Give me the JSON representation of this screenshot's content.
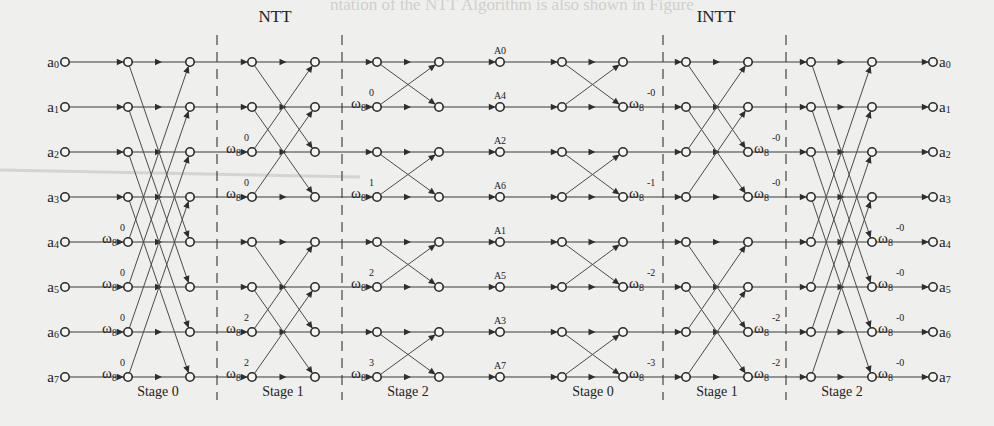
{
  "figure": {
    "sections": [
      {
        "label": "NTT",
        "x": 275,
        "y": 22
      },
      {
        "label": "INTT",
        "x": 716,
        "y": 22
      }
    ],
    "bleed_text": "ntation of the NTT Algorithm is also shown in Figure"
  },
  "layout": {
    "rows_y": [
      62,
      107,
      152,
      197,
      242,
      287,
      332,
      377
    ],
    "input_node_x": 65,
    "output_node_x": 933,
    "dividers_x": [
      217,
      342,
      663,
      786
    ],
    "divider_y": [
      35,
      400
    ]
  },
  "inputs": [
    {
      "base": "a",
      "sub": "0"
    },
    {
      "base": "a",
      "sub": "1"
    },
    {
      "base": "a",
      "sub": "2"
    },
    {
      "base": "a",
      "sub": "3"
    },
    {
      "base": "a",
      "sub": "4"
    },
    {
      "base": "a",
      "sub": "5"
    },
    {
      "base": "a",
      "sub": "6"
    },
    {
      "base": "a",
      "sub": "7"
    }
  ],
  "outputs": [
    {
      "base": "a",
      "sub": "0"
    },
    {
      "base": "a",
      "sub": "1"
    },
    {
      "base": "a",
      "sub": "2"
    },
    {
      "base": "a",
      "sub": "3"
    },
    {
      "base": "a",
      "sub": "4"
    },
    {
      "base": "a",
      "sub": "5"
    },
    {
      "base": "a",
      "sub": "6"
    },
    {
      "base": "a",
      "sub": "7"
    }
  ],
  "intermediate": {
    "x": 500,
    "labels": [
      "A0",
      "A4",
      "A2",
      "A6",
      "A1",
      "A5",
      "A3",
      "A7"
    ]
  },
  "stages": [
    {
      "name": "Stage 0",
      "group": "NTT",
      "x1": 128,
      "x2": 190,
      "label_x": 158,
      "pairs": [
        [
          0,
          4
        ],
        [
          1,
          5
        ],
        [
          2,
          6
        ],
        [
          3,
          7
        ]
      ],
      "twiddles": [
        {
          "row": 4,
          "side": "left",
          "base": "ω",
          "sub": "8",
          "exp": "0"
        },
        {
          "row": 5,
          "side": "left",
          "base": "ω",
          "sub": "8",
          "exp": "0"
        },
        {
          "row": 6,
          "side": "left",
          "base": "ω",
          "sub": "8",
          "exp": "0"
        },
        {
          "row": 7,
          "side": "left",
          "base": "ω",
          "sub": "8",
          "exp": "0"
        }
      ]
    },
    {
      "name": "Stage 1",
      "group": "NTT",
      "x1": 252,
      "x2": 315,
      "label_x": 283,
      "pairs": [
        [
          0,
          2
        ],
        [
          1,
          3
        ],
        [
          4,
          6
        ],
        [
          5,
          7
        ]
      ],
      "twiddles": [
        {
          "row": 2,
          "side": "left",
          "base": "ω",
          "sub": "8",
          "exp": "0"
        },
        {
          "row": 3,
          "side": "left",
          "base": "ω",
          "sub": "8",
          "exp": "0"
        },
        {
          "row": 6,
          "side": "left",
          "base": "ω",
          "sub": "8",
          "exp": "2"
        },
        {
          "row": 7,
          "side": "left",
          "base": "ω",
          "sub": "8",
          "exp": "2"
        }
      ]
    },
    {
      "name": "Stage 2",
      "group": "NTT",
      "x1": 377,
      "x2": 439,
      "label_x": 408,
      "pairs": [
        [
          0,
          1
        ],
        [
          2,
          3
        ],
        [
          4,
          5
        ],
        [
          6,
          7
        ]
      ],
      "twiddles": [
        {
          "row": 1,
          "side": "left",
          "base": "ω",
          "sub": "8",
          "exp": "0"
        },
        {
          "row": 3,
          "side": "left",
          "base": "ω",
          "sub": "8",
          "exp": "1"
        },
        {
          "row": 5,
          "side": "left",
          "base": "ω",
          "sub": "8",
          "exp": "2"
        },
        {
          "row": 7,
          "side": "left",
          "base": "ω",
          "sub": "8",
          "exp": "3"
        }
      ]
    },
    {
      "name": "Stage 0",
      "group": "INTT",
      "x1": 562,
      "x2": 623,
      "label_x": 593,
      "pairs": [
        [
          0,
          1
        ],
        [
          2,
          3
        ],
        [
          4,
          5
        ],
        [
          6,
          7
        ]
      ],
      "twiddles": [
        {
          "row": 1,
          "side": "right",
          "base": "ω",
          "sub": "8",
          "exp": "-0"
        },
        {
          "row": 3,
          "side": "right",
          "base": "ω",
          "sub": "8",
          "exp": "-1"
        },
        {
          "row": 5,
          "side": "right",
          "base": "ω",
          "sub": "8",
          "exp": "-2"
        },
        {
          "row": 7,
          "side": "right",
          "base": "ω",
          "sub": "8",
          "exp": "-3"
        }
      ]
    },
    {
      "name": "Stage 1",
      "group": "INTT",
      "x1": 686,
      "x2": 748,
      "label_x": 717,
      "pairs": [
        [
          0,
          2
        ],
        [
          1,
          3
        ],
        [
          4,
          6
        ],
        [
          5,
          7
        ]
      ],
      "twiddles": [
        {
          "row": 2,
          "side": "right",
          "base": "ω",
          "sub": "8",
          "exp": "-0"
        },
        {
          "row": 3,
          "side": "right",
          "base": "ω",
          "sub": "8",
          "exp": "-0"
        },
        {
          "row": 6,
          "side": "right",
          "base": "ω",
          "sub": "8",
          "exp": "-2"
        },
        {
          "row": 7,
          "side": "right",
          "base": "ω",
          "sub": "8",
          "exp": "-2"
        }
      ]
    },
    {
      "name": "Stage 2",
      "group": "INTT",
      "x1": 811,
      "x2": 872,
      "label_x": 842,
      "pairs": [
        [
          0,
          4
        ],
        [
          1,
          5
        ],
        [
          2,
          6
        ],
        [
          3,
          7
        ]
      ],
      "twiddles": [
        {
          "row": 4,
          "side": "right",
          "base": "ω",
          "sub": "8",
          "exp": "-0"
        },
        {
          "row": 5,
          "side": "right",
          "base": "ω",
          "sub": "8",
          "exp": "-0"
        },
        {
          "row": 6,
          "side": "right",
          "base": "ω",
          "sub": "8",
          "exp": "-0"
        },
        {
          "row": 7,
          "side": "right",
          "base": "ω",
          "sub": "8",
          "exp": "-0"
        }
      ]
    }
  ],
  "colors": {
    "background": "#efefed",
    "ink": "#2a2a2a"
  }
}
